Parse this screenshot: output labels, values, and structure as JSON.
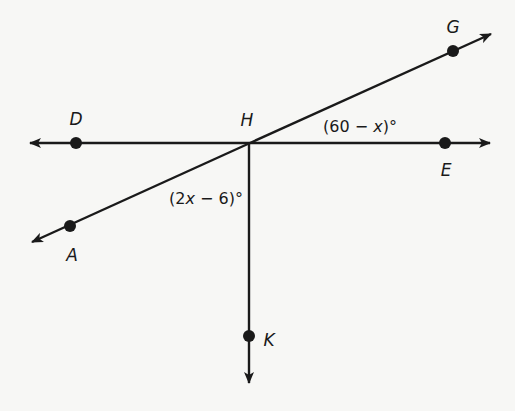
{
  "diagram": {
    "stroke_color": "#1a1a1a",
    "background": "#f7f7f5",
    "vertex": {
      "name": "H",
      "label": "H"
    },
    "points": {
      "D": {
        "label": "D"
      },
      "E": {
        "label": "E"
      },
      "G": {
        "label": "G"
      },
      "A": {
        "label": "A"
      },
      "K": {
        "label": "K"
      }
    },
    "lines": [
      {
        "name": "line-DE",
        "through": [
          "D",
          "H",
          "E"
        ],
        "type": "line"
      },
      {
        "name": "line-AG",
        "through": [
          "A",
          "H",
          "G"
        ],
        "type": "line"
      },
      {
        "name": "ray-HK",
        "through": [
          "H",
          "K"
        ],
        "type": "ray"
      }
    ],
    "angles": {
      "GHE": {
        "prefix": "(60 − ",
        "var": "x",
        "suffix": ")°"
      },
      "AHK": {
        "prefix": "(2",
        "var": "x",
        "suffix": " − 6)°"
      }
    }
  }
}
